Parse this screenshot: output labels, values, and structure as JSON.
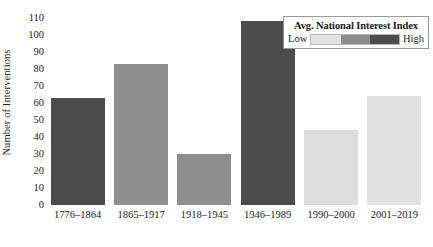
{
  "chart_data": {
    "type": "bar",
    "title": "",
    "xlabel": "",
    "ylabel": "Number of Interventions",
    "categories": [
      "1776–1864",
      "1865–1917",
      "1918–1945",
      "1946–1989",
      "1990–2000",
      "2001–2019"
    ],
    "values": [
      63,
      83,
      30,
      108,
      44,
      64
    ],
    "bar_colors": [
      "#4c4c4c",
      "#8e8e8e",
      "#8e8e8e",
      "#4c4c4c",
      "#dcdcdc",
      "#e2e2e2"
    ],
    "ylim": [
      0,
      110
    ],
    "ytick_values": [
      0,
      10,
      20,
      30,
      40,
      50,
      60,
      70,
      80,
      90,
      100,
      110
    ],
    "ytick_labels": [
      "0",
      "10",
      "20",
      "30",
      "40",
      "50",
      "60",
      "70",
      "80",
      "90",
      "100",
      "110"
    ],
    "grid": false,
    "legend_position": "top-right"
  },
  "legend": {
    "title": "Avg. National Interest Index",
    "low_label": "Low",
    "high_label": "High",
    "gradient_stops": [
      "#e2e2e2",
      "#8e8e8e",
      "#4c4c4c"
    ]
  }
}
